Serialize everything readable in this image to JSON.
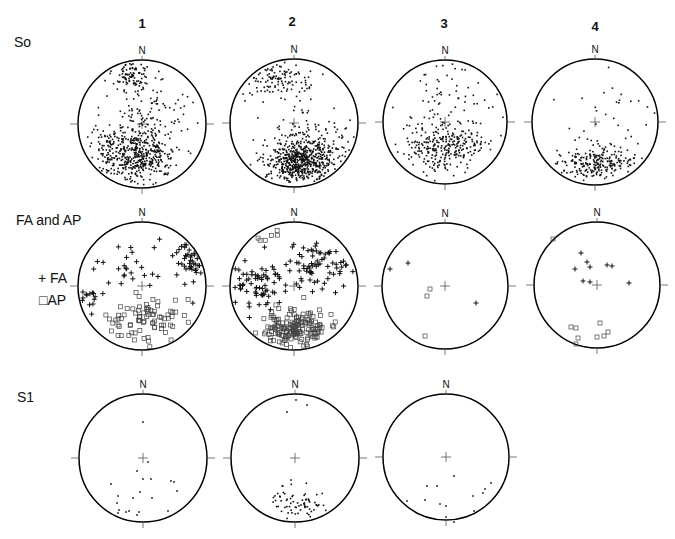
{
  "column_labels": [
    "1",
    "2",
    "3",
    "4"
  ],
  "row_labels": {
    "so": "So",
    "fa_ap": "FA and AP",
    "s1": "S1"
  },
  "legend": {
    "fa": "+ FA",
    "ap": "□AP"
  },
  "north_label": "N",
  "colors": {
    "ink": "#111111",
    "circle": "#000000",
    "ap_marker": "#444444"
  },
  "nets": [
    {
      "row": "so",
      "col": 1,
      "cx": 142,
      "cy": 124,
      "r": 64,
      "marker": "dot",
      "clusters": [
        {
          "n": 420,
          "mx": -0.05,
          "my": 0.48,
          "sx": 0.28,
          "sy": 0.2
        },
        {
          "n": 90,
          "mx": -0.15,
          "my": -0.8,
          "sx": 0.15,
          "sy": 0.12
        },
        {
          "n": 120,
          "mx": 0.05,
          "my": -0.15,
          "sx": 0.35,
          "sy": 0.3
        },
        {
          "n": 60,
          "mx": -0.55,
          "my": 0.5,
          "sx": 0.12,
          "sy": 0.25
        }
      ]
    },
    {
      "row": "so",
      "col": 2,
      "cx": 294,
      "cy": 123,
      "r": 64,
      "marker": "dot",
      "clusters": [
        {
          "n": 600,
          "mx": 0.1,
          "my": 0.58,
          "sx": 0.26,
          "sy": 0.18
        },
        {
          "n": 110,
          "mx": -0.35,
          "my": -0.72,
          "sx": 0.28,
          "sy": 0.15
        },
        {
          "n": 60,
          "mx": 0.5,
          "my": 0.3,
          "sx": 0.25,
          "sy": 0.25
        },
        {
          "n": 25,
          "mx": 0.0,
          "my": -0.2,
          "sx": 0.3,
          "sy": 0.35
        }
      ]
    },
    {
      "row": "so",
      "col": 3,
      "cx": 445,
      "cy": 122,
      "r": 62,
      "marker": "dot",
      "clusters": [
        {
          "n": 300,
          "mx": 0.0,
          "my": 0.4,
          "sx": 0.33,
          "sy": 0.22
        },
        {
          "n": 50,
          "mx": 0.0,
          "my": -0.45,
          "sx": 0.4,
          "sy": 0.3
        }
      ]
    },
    {
      "row": "so",
      "col": 4,
      "cx": 595,
      "cy": 122,
      "r": 63,
      "marker": "dot",
      "clusters": [
        {
          "n": 220,
          "mx": 0.0,
          "my": 0.65,
          "sx": 0.3,
          "sy": 0.12
        },
        {
          "n": 35,
          "mx": 0.15,
          "my": 0.0,
          "sx": 0.4,
          "sy": 0.4
        }
      ]
    },
    {
      "row": "fa_ap",
      "col": 1,
      "cx": 142,
      "cy": 286,
      "r": 64,
      "marker": "mixed",
      "clusters": [
        {
          "n": 40,
          "mx": 0.75,
          "my": -0.45,
          "sx": 0.12,
          "sy": 0.2,
          "type": "fa"
        },
        {
          "n": 25,
          "mx": -0.2,
          "my": -0.4,
          "sx": 0.3,
          "sy": 0.2,
          "type": "fa"
        },
        {
          "n": 14,
          "mx": -0.85,
          "my": 0.2,
          "sx": 0.1,
          "sy": 0.1,
          "type": "fa"
        },
        {
          "n": 80,
          "mx": 0.05,
          "my": 0.55,
          "sx": 0.28,
          "sy": 0.2,
          "type": "ap"
        }
      ]
    },
    {
      "row": "fa_ap",
      "col": 2,
      "cx": 294,
      "cy": 286,
      "r": 64,
      "marker": "mixed",
      "clusters": [
        {
          "n": 70,
          "mx": 0.45,
          "my": -0.3,
          "sx": 0.3,
          "sy": 0.18,
          "type": "fa"
        },
        {
          "n": 70,
          "mx": -0.6,
          "my": 0.0,
          "sx": 0.22,
          "sy": 0.2,
          "type": "fa"
        },
        {
          "n": 160,
          "mx": 0.0,
          "my": 0.65,
          "sx": 0.25,
          "sy": 0.15,
          "type": "ap"
        },
        {
          "n": 6,
          "mx": -0.4,
          "my": -0.8,
          "sx": 0.1,
          "sy": 0.08,
          "type": "ap"
        }
      ]
    },
    {
      "row": "fa_ap",
      "col": 3,
      "cx": 445,
      "cy": 286,
      "r": 63,
      "marker": "mixed",
      "points": [
        {
          "x": 390,
          "y": 269,
          "type": "fa"
        },
        {
          "x": 408,
          "y": 263,
          "type": "fa"
        },
        {
          "x": 476,
          "y": 303,
          "type": "fa"
        },
        {
          "x": 430,
          "y": 289,
          "type": "ap"
        },
        {
          "x": 427,
          "y": 296,
          "type": "ap"
        },
        {
          "x": 425,
          "y": 336,
          "type": "ap"
        }
      ]
    },
    {
      "row": "fa_ap",
      "col": 4,
      "cx": 597,
      "cy": 285,
      "r": 63,
      "marker": "mixed",
      "points": [
        {
          "x": 581,
          "y": 253,
          "type": "fa"
        },
        {
          "x": 587,
          "y": 262,
          "type": "fa"
        },
        {
          "x": 590,
          "y": 267,
          "type": "fa"
        },
        {
          "x": 575,
          "y": 269,
          "type": "fa"
        },
        {
          "x": 607,
          "y": 265,
          "type": "fa"
        },
        {
          "x": 612,
          "y": 266,
          "type": "fa"
        },
        {
          "x": 583,
          "y": 281,
          "type": "fa"
        },
        {
          "x": 590,
          "y": 282,
          "type": "fa"
        },
        {
          "x": 629,
          "y": 283,
          "type": "fa"
        },
        {
          "x": 553,
          "y": 239,
          "type": "ap"
        },
        {
          "x": 571,
          "y": 327,
          "type": "ap"
        },
        {
          "x": 576,
          "y": 328,
          "type": "ap"
        },
        {
          "x": 600,
          "y": 323,
          "type": "ap"
        },
        {
          "x": 578,
          "y": 338,
          "type": "ap"
        },
        {
          "x": 576,
          "y": 344,
          "type": "ap"
        },
        {
          "x": 597,
          "y": 337,
          "type": "ap"
        },
        {
          "x": 604,
          "y": 336,
          "type": "ap"
        },
        {
          "x": 608,
          "y": 332,
          "type": "ap"
        }
      ]
    },
    {
      "row": "s1",
      "col": 1,
      "cx": 143,
      "cy": 458,
      "r": 64,
      "marker": "dot",
      "points": [
        {
          "x": 143,
          "y": 422
        },
        {
          "x": 148,
          "y": 462
        },
        {
          "x": 137,
          "y": 471
        },
        {
          "x": 143,
          "y": 479
        },
        {
          "x": 151,
          "y": 479
        },
        {
          "x": 111,
          "y": 484
        },
        {
          "x": 171,
          "y": 481
        },
        {
          "x": 174,
          "y": 482
        },
        {
          "x": 140,
          "y": 492
        },
        {
          "x": 177,
          "y": 491
        },
        {
          "x": 118,
          "y": 496
        },
        {
          "x": 133,
          "y": 498
        },
        {
          "x": 152,
          "y": 498
        },
        {
          "x": 117,
          "y": 503
        },
        {
          "x": 119,
          "y": 510
        },
        {
          "x": 126,
          "y": 512
        },
        {
          "x": 129,
          "y": 511
        },
        {
          "x": 118,
          "y": 513
        },
        {
          "x": 139,
          "y": 512
        },
        {
          "x": 137,
          "y": 515
        },
        {
          "x": 168,
          "y": 511
        }
      ]
    },
    {
      "row": "s1",
      "col": 2,
      "cx": 295,
      "cy": 458,
      "r": 64,
      "marker": "dot",
      "points": [
        {
          "x": 296,
          "y": 400
        },
        {
          "x": 307,
          "y": 405
        },
        {
          "x": 287,
          "y": 412
        },
        {
          "x": 291,
          "y": 480
        }
      ],
      "clusters": [
        {
          "n": 70,
          "mx": 0.1,
          "my": 0.72,
          "sx": 0.22,
          "sy": 0.12
        }
      ]
    },
    {
      "row": "s1",
      "col": 3,
      "cx": 446,
      "cy": 457,
      "r": 63,
      "marker": "dot",
      "points": [
        {
          "x": 454,
          "y": 476
        },
        {
          "x": 427,
          "y": 486
        },
        {
          "x": 437,
          "y": 486
        },
        {
          "x": 491,
          "y": 483
        },
        {
          "x": 485,
          "y": 489
        },
        {
          "x": 483,
          "y": 493
        },
        {
          "x": 473,
          "y": 496
        },
        {
          "x": 407,
          "y": 501
        },
        {
          "x": 425,
          "y": 500
        },
        {
          "x": 440,
          "y": 504
        },
        {
          "x": 446,
          "y": 506
        },
        {
          "x": 474,
          "y": 511
        },
        {
          "x": 446,
          "y": 517
        },
        {
          "x": 454,
          "y": 522
        }
      ]
    }
  ]
}
